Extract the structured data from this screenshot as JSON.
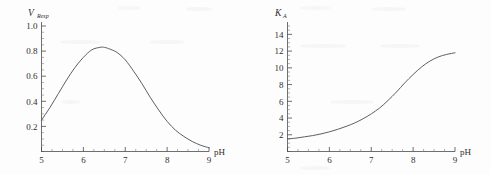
{
  "chart_data": [
    {
      "id": "respiration-rate-vs-ph",
      "type": "line",
      "title": "",
      "xlabel": "pH",
      "ylabel_var": "V",
      "ylabel_sub": "Resp",
      "xlim": [
        5,
        9
      ],
      "ylim": [
        0,
        1.0
      ],
      "xticks": [
        "5",
        "6",
        "7",
        "8",
        "9"
      ],
      "xtick_values": [
        5,
        6,
        7,
        8,
        9
      ],
      "yticks": [
        "0.2",
        "0.4",
        "0.6",
        "0.8",
        "1.0"
      ],
      "ytick_values": [
        0.2,
        0.4,
        0.6,
        0.8,
        1.0
      ],
      "minor_ticks_per_interval": 4,
      "grid": false,
      "legend": "none",
      "x": [
        5.0,
        5.2,
        5.4,
        5.6,
        5.8,
        6.0,
        6.2,
        6.4,
        6.5,
        6.6,
        6.8,
        7.0,
        7.2,
        7.4,
        7.6,
        7.8,
        8.0,
        8.2,
        8.4,
        8.6,
        8.8,
        9.0
      ],
      "values": [
        0.25,
        0.35,
        0.46,
        0.57,
        0.67,
        0.75,
        0.81,
        0.83,
        0.83,
        0.82,
        0.79,
        0.73,
        0.64,
        0.54,
        0.43,
        0.33,
        0.24,
        0.17,
        0.12,
        0.08,
        0.05,
        0.03
      ]
    },
    {
      "id": "association-constant-vs-ph",
      "type": "line",
      "title": "",
      "xlabel": "pH",
      "ylabel_var": "K",
      "ylabel_sub": "A",
      "xlim": [
        5,
        9
      ],
      "ylim": [
        0,
        15
      ],
      "xticks": [
        "5",
        "6",
        "7",
        "8",
        "9"
      ],
      "xtick_values": [
        5,
        6,
        7,
        8,
        9
      ],
      "yticks": [
        "2",
        "4",
        "6",
        "8",
        "10",
        "12",
        "14"
      ],
      "ytick_values": [
        2,
        4,
        6,
        8,
        10,
        12,
        14
      ],
      "minor_ticks_per_interval": 4,
      "grid": false,
      "legend": "none",
      "x": [
        5.0,
        5.2,
        5.4,
        5.6,
        5.8,
        6.0,
        6.2,
        6.4,
        6.6,
        6.8,
        7.0,
        7.2,
        7.4,
        7.6,
        7.8,
        8.0,
        8.2,
        8.4,
        8.6,
        8.8,
        9.0
      ],
      "values": [
        1.5,
        1.6,
        1.75,
        1.9,
        2.1,
        2.35,
        2.65,
        3.0,
        3.4,
        3.9,
        4.5,
        5.2,
        6.1,
        7.1,
        8.2,
        9.2,
        10.1,
        10.8,
        11.3,
        11.6,
        11.8
      ]
    }
  ],
  "colors": {
    "curve": "#55555a",
    "axis": "#4a4a4a",
    "text": "#2e2e2e",
    "background": "#fdfdfd"
  }
}
